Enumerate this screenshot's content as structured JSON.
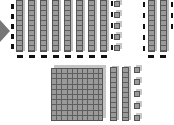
{
  "diagram": {
    "title": "",
    "top_group": {
      "tens_rods": 8,
      "ones_cubes": 5,
      "border": "dashed"
    },
    "right_group": {
      "tens_rods": 2,
      "border": "dashed"
    },
    "bottom_group": {
      "hundreds_flats": 1,
      "tens_rods": 2,
      "ones_cubes": 5
    },
    "arrow_icon": "arrow-right-icon",
    "colors": {
      "block": "#9a9a9a",
      "grid": "#5e5e5e",
      "dash": "#111111",
      "arrow": "#777777"
    }
  }
}
